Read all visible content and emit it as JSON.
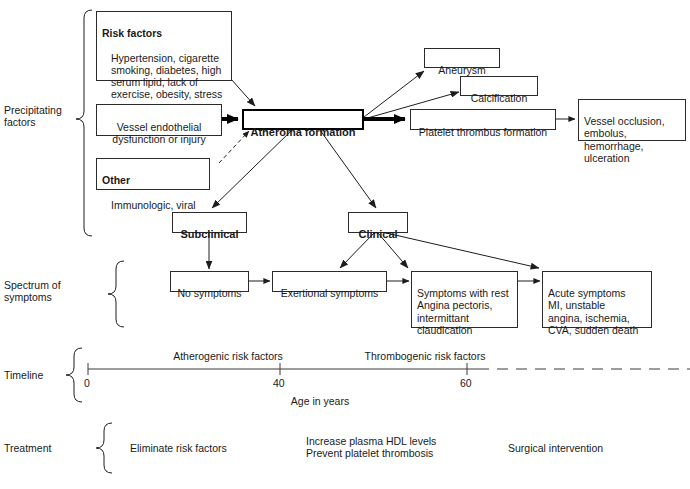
{
  "row_labels": {
    "precipitating": "Precipitating\nfactors",
    "spectrum": "Spectrum of\nsymptoms",
    "timeline": "Timeline",
    "treatment": "Treatment"
  },
  "nodes": {
    "risk_factors": {
      "heading": "Risk factors",
      "body": "Hypertension, cigarette\nsmoking, diabetes, high\nserum lipid, lack of\nexercise, obesity, stress"
    },
    "vessel_endothelial": {
      "label": "Vessel endothelial\ndysfunction or injury"
    },
    "other": {
      "heading": "Other",
      "body": "Immunologic, viral"
    },
    "atheroma": {
      "label": "Atheroma formation"
    },
    "aneurysm": {
      "label": "Aneurysm"
    },
    "calcification": {
      "label": "Calcification"
    },
    "platelet_thrombus": {
      "label": "Platelet thrombus formation"
    },
    "vessel_occlusion": {
      "label": "Vessel occlusion,\nembolus, hemorrhage,\nulceration"
    },
    "subclinical": {
      "label": "Subclinical"
    },
    "clinical": {
      "label": "Clinical"
    },
    "no_symptoms": {
      "label": "No symptoms"
    },
    "exertional_symptoms": {
      "label": "Exertional symptoms"
    },
    "symptoms_with_rest": {
      "label": "Symptoms with rest\n  Angina pectoris,\n  intermittant\n  claudication"
    },
    "acute_symptoms": {
      "label": "Acute symptoms\n  MI, unstable\n  angina, ischemia,\n  CVA, sudden death"
    }
  },
  "timeline": {
    "band_left_label": "Atherogenic risk factors",
    "band_right_label": "Thrombogenic risk factors",
    "axis_title": "Age in years",
    "ticks": [
      {
        "value": "0",
        "x": 88
      },
      {
        "value": "40",
        "x": 280
      },
      {
        "value": "60",
        "x": 467
      }
    ],
    "axis_range": [
      0,
      60
    ],
    "dashed_after_value": "60"
  },
  "treatment": {
    "items": [
      {
        "text": "Eliminate risk factors"
      },
      {
        "text": "Increase plasma HDL levels\nPrevent platelet thrombosis"
      },
      {
        "text": "Surgical intervention"
      }
    ]
  },
  "colors": {
    "ink": "#1a1a1a",
    "rule": "#2b2b2b",
    "paper": "#ffffff"
  }
}
